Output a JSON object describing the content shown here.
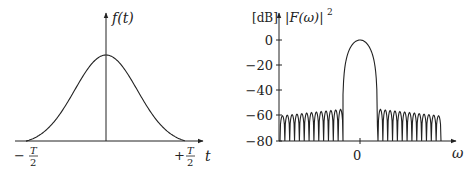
{
  "chart_data": [
    {
      "type": "line",
      "title": "",
      "description": "Tapered (Gaussian-like) window in time domain",
      "xlabel": "t",
      "ylabel": "f(t)",
      "x_ticks": [
        "-T/2",
        "+T/2"
      ],
      "x": [
        -0.5,
        -0.4,
        -0.3,
        -0.2,
        -0.1,
        0,
        0.1,
        0.2,
        0.3,
        0.4,
        0.5
      ],
      "values": [
        0.0,
        0.06,
        0.2,
        0.52,
        0.87,
        1.0,
        0.87,
        0.52,
        0.2,
        0.06,
        0.0
      ],
      "grid": false
    },
    {
      "type": "line",
      "title": "",
      "description": "Power spectrum of window in dB",
      "xlabel": "ω",
      "ylabel": "|F(ω)|²",
      "yunit": "[dB]",
      "x_ticks": [
        "0"
      ],
      "y_ticks": [
        0,
        -20,
        -40,
        -60,
        -80
      ],
      "ylim": [
        -80,
        0
      ],
      "main_lobe_peak_db": 0,
      "first_sidelobe_db": -55,
      "far_sidelobe_db": -60,
      "sidelobes_per_side": 13,
      "grid": false
    }
  ],
  "left": {
    "ylabel": "f(t)",
    "xlabel": "t",
    "tick_left_sign": "−",
    "tick_right_sign": "+",
    "tick_num": "T",
    "tick_den": "2"
  },
  "right": {
    "unit": "[dB]",
    "ylabel": "|F(ω)|",
    "ylabel_exp": "2",
    "xlabel": "ω",
    "xtick": "0",
    "yticks": [
      "0",
      "−20",
      "−40",
      "−60",
      "−80"
    ]
  }
}
